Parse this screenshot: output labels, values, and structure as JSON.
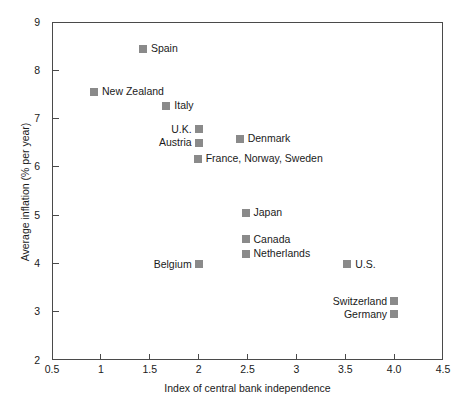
{
  "chart_data": {
    "type": "scatter",
    "title": "",
    "xlabel": "Index of central bank independence",
    "ylabel": "Average inflation (% per year)",
    "xlim": [
      0.5,
      4.5
    ],
    "ylim": [
      2,
      9
    ],
    "grid": false,
    "legend": "none",
    "xticks": [
      "0.5",
      "1",
      "1.5",
      "2",
      "2.5",
      "3",
      "3.5",
      "4.0",
      "4.5"
    ],
    "xtick_values": [
      0.5,
      1,
      1.5,
      2,
      2.5,
      3,
      3.5,
      4.0,
      4.5
    ],
    "yticks": [
      "2",
      "3",
      "4",
      "5",
      "6",
      "7",
      "8",
      "9"
    ],
    "ytick_values": [
      2,
      3,
      4,
      5,
      6,
      7,
      8,
      9
    ],
    "marker_color": "#8a8a8a",
    "axis_color": "#4a4a4a",
    "points": [
      {
        "label": "Spain",
        "x": 1.43,
        "y": 8.45,
        "label_side": "right"
      },
      {
        "label": "New Zealand",
        "x": 0.93,
        "y": 7.56,
        "label_side": "right"
      },
      {
        "label": "Italy",
        "x": 1.67,
        "y": 7.27,
        "label_side": "right"
      },
      {
        "label": "U.K.",
        "x": 2.0,
        "y": 6.78,
        "label_side": "left"
      },
      {
        "label": "Austria",
        "x": 2.0,
        "y": 6.5,
        "label_side": "left"
      },
      {
        "label": "Denmark",
        "x": 2.42,
        "y": 6.58,
        "label_side": "right"
      },
      {
        "label": "France, Norway, Sweden",
        "x": 1.99,
        "y": 6.17,
        "label_side": "right"
      },
      {
        "label": "Japan",
        "x": 2.48,
        "y": 5.05,
        "label_side": "right"
      },
      {
        "label": "Canada",
        "x": 2.48,
        "y": 4.5,
        "label_side": "right"
      },
      {
        "label": "Netherlands",
        "x": 2.48,
        "y": 4.2,
        "label_side": "right"
      },
      {
        "label": "Belgium",
        "x": 2.0,
        "y": 3.98,
        "label_side": "left"
      },
      {
        "label": "U.S.",
        "x": 3.52,
        "y": 3.98,
        "label_side": "right"
      },
      {
        "label": "Switzerland",
        "x": 4.0,
        "y": 3.22,
        "label_side": "left"
      },
      {
        "label": "Germany",
        "x": 4.0,
        "y": 2.95,
        "label_side": "left"
      }
    ]
  }
}
